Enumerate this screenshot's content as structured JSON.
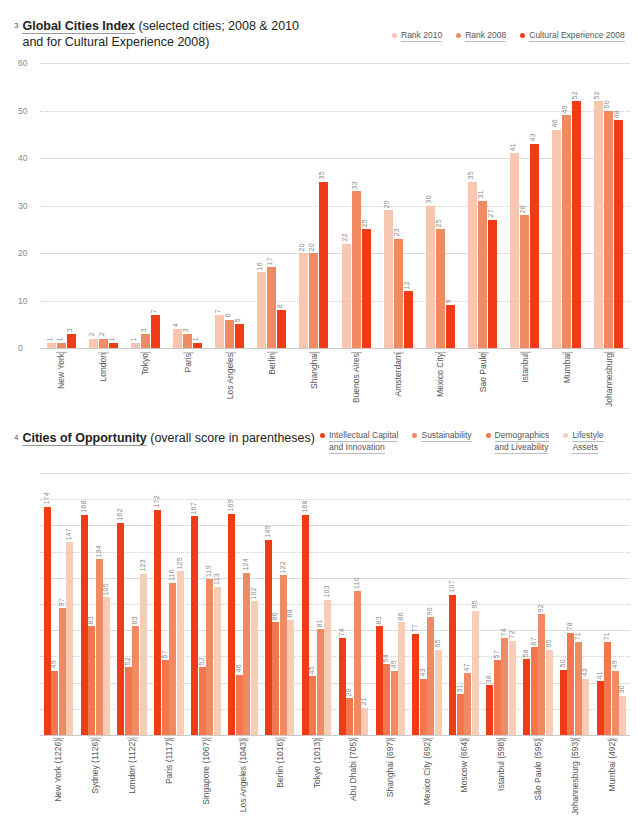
{
  "chart1": {
    "number": "3",
    "title_bold": "Global Cities Index",
    "title_rest": "(selected cities; 2008 & 2010",
    "title_line2": "and for Cultural Experience 2008)",
    "legend": [
      {
        "label": "Rank 2010",
        "color": "#f8c5ae"
      },
      {
        "label": "Rank 2008",
        "color": "#f08a63"
      },
      {
        "label": "Cultural Experience 2008",
        "color": "#ef3c17"
      }
    ],
    "yticks": [
      "0",
      "10",
      "20",
      "30",
      "40",
      "50",
      "60"
    ]
  },
  "chart2": {
    "number": "4",
    "title_bold": "Cities of Opportunity",
    "title_rest": "(overall score in parentheses)",
    "legend": [
      {
        "label": "Intellectual Capital",
        "label2": "and Innovation",
        "color": "#ef3c17"
      },
      {
        "label": "Sustainability",
        "label2": "",
        "color": "#f08a63"
      },
      {
        "label": "Demographics",
        "label2": "and Liveability",
        "color": "#f4764e"
      },
      {
        "label": "Lifestyle",
        "label2": "Assets",
        "color": "#f9cdb5"
      }
    ],
    "yticks": [
      "0",
      "20",
      "40",
      "60",
      "80",
      "100",
      "120",
      "140",
      "160",
      "180",
      "200"
    ]
  },
  "chart_data": [
    {
      "type": "bar",
      "title": "Global Cities Index (selected cities; 2008 & 2010 and for Cultural Experience 2008)",
      "xlabel": "",
      "ylabel": "",
      "ylim": [
        0,
        60
      ],
      "grid": true,
      "legend_position": "top-right",
      "categories": [
        "New York",
        "London",
        "Tokyo",
        "Paris",
        "Los Angeles",
        "Berlin",
        "Shanghai",
        "Buenos Aires",
        "Amsterdam",
        "Mexico City",
        "Sao Paulo",
        "Istanbul",
        "Mumbai",
        "Johannesburg"
      ],
      "series": [
        {
          "name": "Rank 2010",
          "color": "#f8c5ae",
          "values": [
            1,
            2,
            1,
            4,
            7,
            16,
            20,
            22,
            29,
            30,
            35,
            41,
            46,
            52
          ]
        },
        {
          "name": "Rank 2008",
          "color": "#f08a63",
          "values": [
            1,
            2,
            3,
            3,
            6,
            17,
            20,
            33,
            23,
            25,
            31,
            28,
            49,
            50
          ]
        },
        {
          "name": "Cultural Experience 2008",
          "color": "#ef3c17",
          "values": [
            3,
            1,
            7,
            1,
            5,
            8,
            35,
            25,
            12,
            9,
            27,
            43,
            52,
            48
          ]
        }
      ]
    },
    {
      "type": "bar",
      "title": "Cities of Opportunity (overall score in parentheses)",
      "xlabel": "",
      "ylabel": "",
      "ylim": [
        0,
        200
      ],
      "grid": true,
      "legend_position": "top-right",
      "categories": [
        "New York (1226)",
        "Sydney (1126)",
        "London (1122)",
        "Paris (1117)",
        "Singapore (1067)",
        "Los Angeles (1043)",
        "Berlin (1016)",
        "Tokyo (1013)",
        "Abu Dhabi (705)",
        "Shanghai (697)",
        "Mexico City (692)",
        "Moscow (664)",
        "Istanbul (598)",
        "São Paulo (595)",
        "Johannesburg (593)",
        "Mumbai (492)"
      ],
      "series": [
        {
          "name": "Intellectual Capital and Innovation",
          "color": "#ef3c17",
          "values": [
            174,
            168,
            162,
            172,
            167,
            169,
            149,
            168,
            74,
            83,
            77,
            107,
            38,
            58,
            50,
            41
          ]
        },
        {
          "name": "Sustainability",
          "color": "#f4764e",
          "values": [
            49,
            83,
            52,
            57,
            52,
            46,
            86,
            45,
            28,
            54,
            43,
            31,
            57,
            67,
            78,
            71
          ]
        },
        {
          "name": "Demographics and Liveability",
          "color": "#f08a63",
          "values": [
            97,
            134,
            83,
            116,
            119,
            124,
            122,
            81,
            110,
            49,
            90,
            47,
            74,
            92,
            71,
            49
          ]
        },
        {
          "name": "Lifestyle Assets",
          "color": "#f9cdb5",
          "values": [
            147,
            105,
            123,
            125,
            113,
            102,
            88,
            103,
            21,
            86,
            65,
            95,
            72,
            65,
            43,
            30
          ]
        }
      ]
    }
  ]
}
